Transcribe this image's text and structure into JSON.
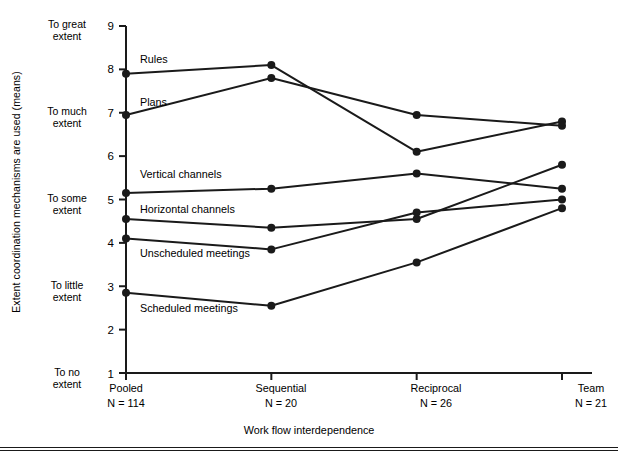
{
  "axes": {
    "ytitle": "Extent coordination mechanisms are used (means)",
    "xtitle": "Work flow interdependence",
    "yticks": [
      "9",
      "8",
      "7",
      "6",
      "5",
      "4",
      "3",
      "2",
      "1"
    ],
    "ycategories": [
      {
        "line1": "To great",
        "line2": "extent",
        "value": 9
      },
      {
        "line1": "To much",
        "line2": "extent",
        "value": 7
      },
      {
        "line1": "To some",
        "line2": "extent",
        "value": 5
      },
      {
        "line1": "To little",
        "line2": "extent",
        "value": 3
      },
      {
        "line1": "To no",
        "line2": "extent",
        "value": 1
      }
    ],
    "xcategories": [
      {
        "name": "Pooled",
        "n": "N = 114"
      },
      {
        "name": "Sequential",
        "n": "N = 20"
      },
      {
        "name": "Reciprocal",
        "n": "N = 26"
      },
      {
        "name": "Team",
        "n": "N = 21"
      }
    ]
  },
  "series_labels": [
    {
      "label": "Rules"
    },
    {
      "label": "Plans"
    },
    {
      "label": "Vertical channels"
    },
    {
      "label": "Horizontal channels"
    },
    {
      "label": "Unscheduled meetings"
    },
    {
      "label": "Scheduled meetings"
    }
  ],
  "chart_data": {
    "type": "line",
    "title": "",
    "xlabel": "Work flow interdependence",
    "ylabel": "Extent coordination mechanisms are used (means)",
    "categories": [
      "Pooled",
      "Sequential",
      "Reciprocal",
      "Team"
    ],
    "category_counts": [
      "N = 114",
      "N = 20",
      "N = 26",
      "N = 21"
    ],
    "ylim": [
      1,
      9
    ],
    "ytick_values": [
      1,
      2,
      3,
      4,
      5,
      6,
      7,
      8,
      9
    ],
    "ytick_category_labels": {
      "9": "To great extent",
      "7": "To much extent",
      "5": "To some extent",
      "3": "To little extent",
      "1": "To no extent"
    },
    "grid": false,
    "legend": "inline-labels",
    "marker": "filled-circle",
    "line_color": "#1a1a1a",
    "series": [
      {
        "name": "Rules",
        "values": [
          7.9,
          8.1,
          6.1,
          6.8
        ]
      },
      {
        "name": "Plans",
        "values": [
          6.95,
          7.8,
          6.95,
          6.7
        ]
      },
      {
        "name": "Vertical channels",
        "values": [
          5.15,
          5.25,
          5.6,
          5.25
        ]
      },
      {
        "name": "Horizontal channels",
        "values": [
          4.55,
          4.35,
          4.55,
          5.8
        ]
      },
      {
        "name": "Unscheduled meetings",
        "values": [
          4.1,
          3.85,
          4.7,
          5.0
        ]
      },
      {
        "name": "Scheduled meetings",
        "values": [
          2.85,
          2.55,
          3.55,
          4.8
        ]
      }
    ]
  }
}
